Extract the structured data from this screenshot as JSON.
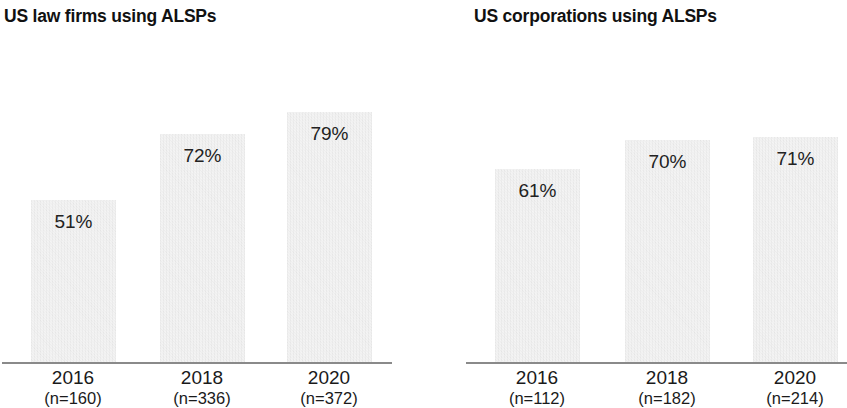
{
  "chart_data": [
    {
      "type": "bar",
      "title": "US law firms using ALSPs",
      "xlabel": "",
      "ylabel": "",
      "ylim": [
        0,
        100
      ],
      "grid": false,
      "legend": "none",
      "categories": [
        "2016",
        "2018",
        "2020"
      ],
      "category_sublabels": [
        "(n=160)",
        "(n=336)",
        "(n=372)"
      ],
      "values": [
        51,
        72,
        79
      ],
      "value_labels": [
        "51%",
        "72%",
        "79%"
      ],
      "sample_sizes": [
        160,
        336,
        372
      ],
      "bar_color": "#e6e6e6",
      "label_color": "#222222",
      "axis_color": "#8a8a8a"
    },
    {
      "type": "bar",
      "title": "US corporations using ALSPs",
      "xlabel": "",
      "ylabel": "",
      "ylim": [
        0,
        100
      ],
      "grid": false,
      "legend": "none",
      "categories": [
        "2016",
        "2018",
        "2020"
      ],
      "category_sublabels": [
        "(n=112)",
        "(n=182)",
        "(n=214)"
      ],
      "values": [
        61,
        70,
        71
      ],
      "value_labels": [
        "61%",
        "70%",
        "71%"
      ],
      "sample_sizes": [
        112,
        182,
        214
      ],
      "bar_color": "#e6e6e6",
      "label_color": "#222222",
      "axis_color": "#8a8a8a"
    }
  ]
}
